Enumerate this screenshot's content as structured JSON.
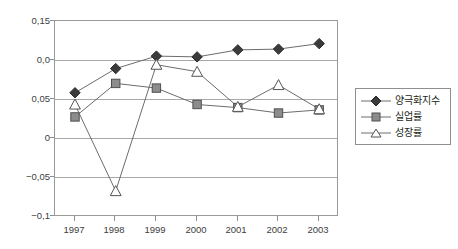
{
  "chart_data": {
    "type": "line",
    "title": "",
    "subtitle": "",
    "xlabel": "",
    "ylabel": "",
    "grid": true,
    "legend_position": "right",
    "categories": [
      "1997",
      "1998",
      "1999",
      "2000",
      "2001",
      "2002",
      "2003"
    ],
    "y_tick_labels": [
      "0,15",
      "0,0",
      "0,05",
      "0",
      "−0,05",
      "−0,1"
    ],
    "y_tick_values": [
      0.15,
      0.1,
      0.05,
      0.0,
      -0.05,
      -0.1
    ],
    "ylim": [
      -0.1,
      0.15
    ],
    "series": [
      {
        "name": "양극화지수",
        "marker": "diamond-filled",
        "marker_color": "#3b3b3b",
        "line_color": "#6d6d6d",
        "values": [
          0.058,
          0.089,
          0.105,
          0.104,
          0.113,
          0.114,
          0.121
        ]
      },
      {
        "name": "실업률",
        "marker": "square-filled",
        "marker_color": "#8c8c8c",
        "line_color": "#6d6d6d",
        "values": [
          0.027,
          0.07,
          0.064,
          0.043,
          0.039,
          0.032,
          0.036
        ]
      },
      {
        "name": "성장률",
        "marker": "triangle-open",
        "marker_color": "#ffffff",
        "line_color": "#6d6d6d",
        "values": [
          0.043,
          -0.068,
          0.094,
          0.085,
          0.04,
          0.068,
          0.037
        ]
      }
    ]
  },
  "legend": {
    "items": [
      {
        "label": "양극화지수"
      },
      {
        "label": "실업률"
      },
      {
        "label": "성장률"
      }
    ]
  },
  "colors": {
    "frame": "#9a9a9a",
    "grid": "#a8a8a8",
    "text": "#231f20",
    "background": "#ffffff"
  }
}
